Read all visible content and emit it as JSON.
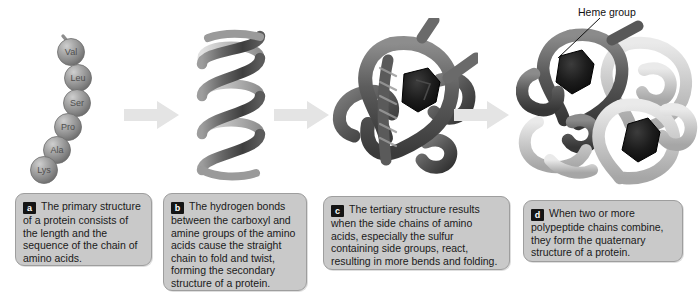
{
  "figure": {
    "background_color": "#ffffff"
  },
  "colors": {
    "caption_fill": "#c9c9c9",
    "caption_border": "#9e9e9e",
    "badge_fill": "#141414",
    "badge_text": "#ffffff",
    "arrow_fill": "#e3e3e3",
    "bead_fill": "#9a9a9a",
    "helix_dark": "#4f4f4f",
    "helix_light": "#d2d2d2",
    "chain_dark": "#575757",
    "chain_light": "#c4c4c4",
    "heme_black": "#141414",
    "text": "#1a1a1a"
  },
  "panels": [
    {
      "key": "a",
      "badge": "a",
      "name": "primary-structure",
      "caption": "The primary structure of a protein consists of the length and the sequence of the chain of amino acids."
    },
    {
      "key": "b",
      "badge": "b",
      "name": "secondary-structure",
      "caption": "The hydrogen bonds between the carboxyl and amine groups of the amino acids cause the straight chain to fold and twist, forming the secondary structure of a protein."
    },
    {
      "key": "c",
      "badge": "c",
      "name": "tertiary-structure",
      "caption": "The tertiary structure results when the side chains of amino acids, especially the sulfur containing side groups, react, resulting in more bends and folding."
    },
    {
      "key": "d",
      "badge": "d",
      "name": "quaternary-structure",
      "caption": "When two or more polypeptide chains combine, they form the quaternary structure of a protein."
    }
  ],
  "amino_acid_chain": {
    "residues": [
      "Val",
      "Leu",
      "Ser",
      "Pro",
      "Ala",
      "Lys"
    ],
    "bead_count": 6
  },
  "annotations": {
    "heme_group": "Heme group"
  },
  "arrows": {
    "count": 3,
    "direction": "right",
    "icon": "right-arrow-icon"
  },
  "secondary": {
    "shape": "alpha-helix-ribbon",
    "turns": 3.5
  },
  "quaternary": {
    "subunits": 4,
    "dark_subunits": 2,
    "light_subunits": 2,
    "heme_groups_visible": 2
  }
}
